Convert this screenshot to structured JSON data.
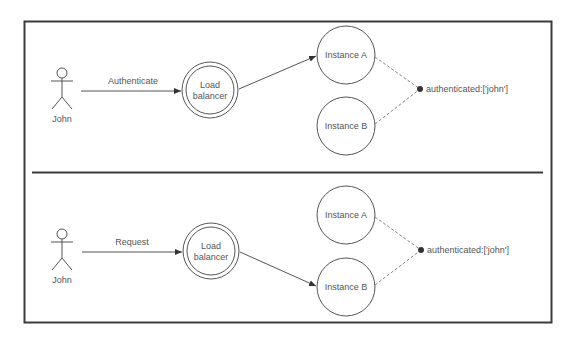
{
  "diagram": {
    "type": "load-balancer-session-sharing",
    "colors": {
      "frame": "#3a3a3a",
      "line": "#555555",
      "dashed": "#888888",
      "dot": "#333333",
      "text": "#555555"
    },
    "panels": [
      {
        "id": "top",
        "actor": {
          "label": "John"
        },
        "request_arrow": {
          "label": "Authenticate"
        },
        "load_balancer": {
          "label_line1": "Load",
          "label_line2": "balancer"
        },
        "instances": [
          {
            "label": "Instance A",
            "targeted": true
          },
          {
            "label": "Instance B",
            "targeted": false
          }
        ],
        "shared_state": {
          "label": "authenticated:['john']"
        }
      },
      {
        "id": "bottom",
        "actor": {
          "label": "John"
        },
        "request_arrow": {
          "label": "Request"
        },
        "load_balancer": {
          "label_line1": "Load",
          "label_line2": "balancer"
        },
        "instances": [
          {
            "label": "Instance A",
            "targeted": false
          },
          {
            "label": "Instance B",
            "targeted": true
          }
        ],
        "shared_state": {
          "label": "authenticated:['john']"
        }
      }
    ]
  }
}
